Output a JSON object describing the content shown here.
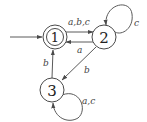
{
  "diagram": {
    "type": "finite-automaton",
    "start_state": "1",
    "states": [
      {
        "id": "1",
        "label": "1",
        "accepting": true
      },
      {
        "id": "2",
        "label": "2",
        "accepting": false
      },
      {
        "id": "3",
        "label": "3",
        "accepting": false
      }
    ],
    "transitions": [
      {
        "from": "1",
        "to": "2",
        "label": "a,b,c"
      },
      {
        "from": "2",
        "to": "1",
        "label": "a"
      },
      {
        "from": "2",
        "to": "2",
        "label": "c"
      },
      {
        "from": "2",
        "to": "3",
        "label": "b"
      },
      {
        "from": "3",
        "to": "1",
        "label": "b"
      },
      {
        "from": "3",
        "to": "3",
        "label": "a,c"
      }
    ]
  }
}
